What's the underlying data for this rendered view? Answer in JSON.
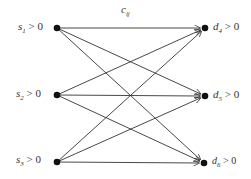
{
  "diagram": {
    "type": "bipartite transportation network",
    "edge_label": {
      "base": "c",
      "sub": "ij"
    },
    "sources": [
      {
        "id": "s1",
        "base": "s",
        "sub": "1",
        "cond": " > 0",
        "x": 57,
        "y": 28
      },
      {
        "id": "s2",
        "base": "s",
        "sub": "2",
        "cond": " > 0",
        "x": 57,
        "y": 95
      },
      {
        "id": "s3",
        "base": "s",
        "sub": "3",
        "cond": " > 0",
        "x": 57,
        "y": 162
      }
    ],
    "destinations": [
      {
        "id": "d4",
        "base": "d",
        "sub": "4",
        "cond": " > 0",
        "x": 205,
        "y": 28
      },
      {
        "id": "d5",
        "base": "d",
        "sub": "5",
        "cond": " > 0",
        "x": 205,
        "y": 96
      },
      {
        "id": "d6",
        "base": "d",
        "sub": "6",
        "cond": " > 0",
        "x": 204,
        "y": 163
      }
    ],
    "edges": "every source connects to every destination (directed arrows)",
    "colors": {
      "line": "#333333",
      "node": "#111111"
    }
  }
}
